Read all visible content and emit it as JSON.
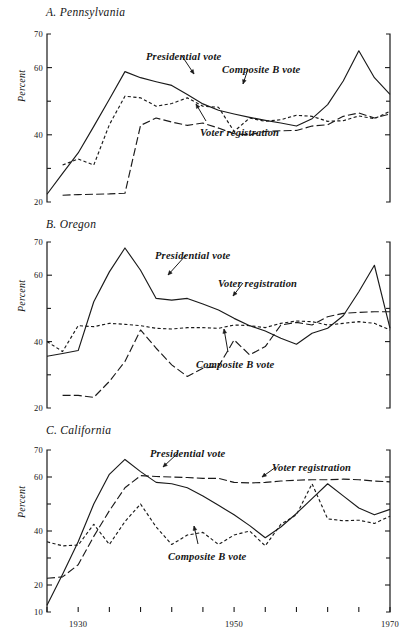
{
  "figure": {
    "top_note": "",
    "y_axis_label": "Percent",
    "series_names": {
      "presidential": "Presidential vote",
      "composite": "Composite B vote",
      "registration": "Voter registration"
    },
    "line_colors": {
      "ink": "#1a1a1a"
    }
  },
  "chart_data": [
    {
      "type": "line",
      "title": "A. Pennsylvania",
      "panel": "A",
      "xlabel": "",
      "ylabel": "Percent",
      "xlim": [
        1926,
        1970
      ],
      "ylim": [
        20,
        70
      ],
      "yticks": [
        20,
        30,
        40,
        50,
        60,
        70
      ],
      "ytick_labels": [
        "20",
        "",
        "40",
        "",
        "60",
        "70"
      ],
      "xticks": [
        1926,
        1930,
        1934,
        1938,
        1942,
        1946,
        1950,
        1954,
        1958,
        1962,
        1966,
        1970
      ],
      "xtick_labels": [
        "",
        "",
        "",
        "",
        "",
        "",
        "",
        "",
        "",
        "",
        "",
        ""
      ],
      "grid": false,
      "legend": "annotations",
      "x": [
        1926,
        1928,
        1930,
        1932,
        1934,
        1936,
        1938,
        1940,
        1942,
        1944,
        1946,
        1948,
        1950,
        1952,
        1954,
        1956,
        1958,
        1960,
        1962,
        1964,
        1966,
        1968,
        1970
      ],
      "series": [
        {
          "name": "Presidential vote",
          "style": "solid",
          "values": [
            22.3,
            28.5,
            34.6,
            42.5,
            50.6,
            58.8,
            57.0,
            55.8,
            54.7,
            52.0,
            49.2,
            47.3,
            46.2,
            45.2,
            44.3,
            43.5,
            42.6,
            44.8,
            49.0,
            56.0,
            65.0,
            57.0,
            52.0
          ]
        },
        {
          "name": "Composite B vote",
          "style": "short-dash",
          "values": [
            null,
            31.0,
            32.8,
            31.0,
            43.0,
            51.5,
            51.0,
            48.5,
            49.3,
            51.0,
            48.5,
            48.2,
            41.0,
            45.0,
            44.0,
            44.5,
            45.8,
            45.5,
            44.0,
            44.2,
            45.6,
            44.8,
            47.0
          ]
        },
        {
          "name": "Voter registration",
          "style": "long-dash",
          "values": [
            null,
            22.0,
            22.2,
            22.3,
            22.4,
            22.6,
            42.8,
            45.0,
            43.8,
            42.8,
            43.5,
            42.0,
            40.3,
            40.0,
            41.0,
            41.2,
            41.3,
            42.6,
            43.0,
            45.5,
            46.5,
            45.0,
            46.2
          ]
        }
      ]
    },
    {
      "type": "line",
      "title": "B. Oregon",
      "panel": "B",
      "xlabel": "",
      "ylabel": "Percent",
      "xlim": [
        1926,
        1970
      ],
      "ylim": [
        20,
        70
      ],
      "yticks": [
        20,
        30,
        40,
        50,
        60,
        70
      ],
      "ytick_labels": [
        "20",
        "",
        "40",
        "",
        "60",
        "70"
      ],
      "xticks": [
        1926,
        1930,
        1934,
        1938,
        1942,
        1946,
        1950,
        1954,
        1958,
        1962,
        1966,
        1970
      ],
      "xtick_labels": [
        "",
        "",
        "",
        "",
        "",
        "",
        "",
        "",
        "",
        "",
        "",
        ""
      ],
      "grid": false,
      "legend": "annotations",
      "x": [
        1926,
        1928,
        1930,
        1932,
        1934,
        1936,
        1938,
        1940,
        1942,
        1944,
        1946,
        1948,
        1950,
        1952,
        1954,
        1956,
        1958,
        1960,
        1962,
        1964,
        1966,
        1968,
        1970
      ],
      "series": [
        {
          "name": "Presidential vote",
          "style": "solid",
          "values": [
            35.6,
            36.4,
            37.3,
            52.0,
            61.0,
            68.2,
            61.5,
            53.0,
            52.5,
            53.0,
            51.3,
            49.5,
            47.0,
            44.8,
            43.2,
            41.0,
            39.2,
            42.5,
            44.0,
            47.8,
            55.0,
            63.0,
            44.0
          ]
        },
        {
          "name": "Composite B vote",
          "style": "short-dash",
          "values": [
            40.0,
            37.0,
            44.8,
            44.5,
            45.5,
            45.2,
            44.8,
            44.0,
            43.8,
            44.2,
            44.2,
            44.0,
            45.0,
            44.8,
            44.2,
            45.5,
            46.2,
            46.0,
            45.0,
            45.5,
            46.0,
            45.5,
            43.5
          ]
        },
        {
          "name": "Voter registration",
          "style": "long-dash",
          "values": [
            null,
            23.8,
            23.8,
            23.2,
            28.0,
            34.0,
            43.5,
            38.0,
            33.0,
            29.5,
            32.0,
            32.5,
            40.5,
            36.0,
            38.5,
            45.0,
            45.8,
            45.0,
            47.5,
            48.5,
            48.8,
            49.0,
            49.0
          ]
        }
      ]
    },
    {
      "type": "line",
      "title": "C. California",
      "panel": "C",
      "xlabel": "",
      "ylabel": "Percent",
      "xlim": [
        1926,
        1970
      ],
      "ylim": [
        10,
        70
      ],
      "yticks": [
        10,
        20,
        30,
        40,
        50,
        60,
        70
      ],
      "ytick_labels": [
        "10",
        "20",
        "",
        "40",
        "",
        "60",
        "70"
      ],
      "xticks": [
        1926,
        1930,
        1934,
        1938,
        1942,
        1946,
        1950,
        1954,
        1958,
        1962,
        1966,
        1970
      ],
      "xtick_labels": [
        "",
        "1930",
        "",
        "",
        "",
        "",
        "1950",
        "",
        "",
        "",
        "",
        "1970"
      ],
      "grid": false,
      "legend": "annotations",
      "x": [
        1926,
        1928,
        1930,
        1932,
        1934,
        1936,
        1938,
        1940,
        1942,
        1944,
        1946,
        1948,
        1950,
        1952,
        1954,
        1956,
        1958,
        1960,
        1962,
        1964,
        1966,
        1968,
        1970
      ],
      "series": [
        {
          "name": "Presidential vote",
          "style": "solid",
          "values": [
            12.5,
            24.0,
            36.0,
            50.0,
            61.0,
            66.5,
            62.0,
            58.0,
            57.5,
            56.0,
            53.0,
            49.5,
            46.0,
            42.0,
            37.5,
            41.5,
            46.5,
            52.0,
            57.5,
            53.0,
            48.5,
            46.0,
            48.0
          ]
        },
        {
          "name": "Composite B vote",
          "style": "short-dash",
          "values": [
            36.0,
            34.5,
            34.8,
            42.5,
            35.0,
            43.5,
            50.0,
            41.5,
            35.0,
            38.5,
            39.5,
            35.0,
            38.5,
            40.0,
            34.5,
            42.5,
            46.0,
            57.5,
            44.5,
            43.8,
            44.0,
            42.8,
            45.5
          ]
        },
        {
          "name": "Voter registration",
          "style": "long-dash",
          "values": [
            22.5,
            23.0,
            27.5,
            38.0,
            47.5,
            56.0,
            60.5,
            60.2,
            60.0,
            59.8,
            59.5,
            59.5,
            58.0,
            57.8,
            58.0,
            58.5,
            58.8,
            59.0,
            59.0,
            59.2,
            59.0,
            58.5,
            58.2
          ]
        }
      ]
    }
  ],
  "annotations": {
    "A": [
      {
        "label": "Presidential vote"
      },
      {
        "label": "Composite B vote"
      },
      {
        "label": "Voter registration"
      }
    ],
    "B": [
      {
        "label": "Presidential vote"
      },
      {
        "label": "Voter registration"
      },
      {
        "label": "Composite B vote"
      }
    ],
    "C": [
      {
        "label": "Presidential vote"
      },
      {
        "label": "Voter registration"
      },
      {
        "label": "Composite B vote"
      }
    ]
  }
}
